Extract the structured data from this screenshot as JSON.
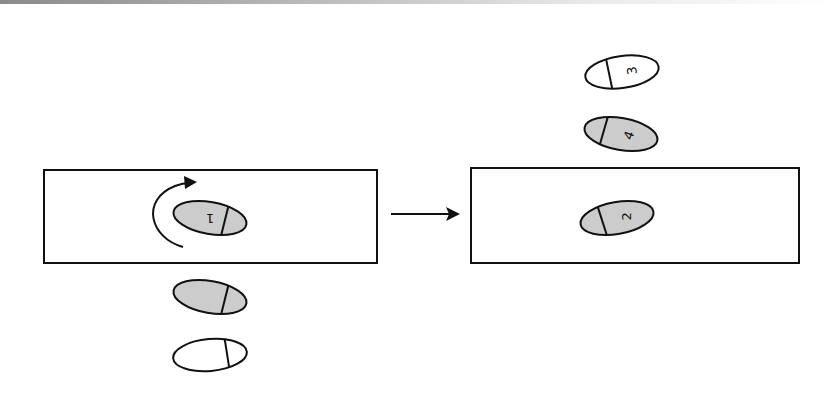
{
  "diagram": {
    "colors": {
      "stroke": "#111111",
      "filled_foot": "#cccccc",
      "empty_foot": "#ffffff",
      "background": "#ffffff"
    },
    "panels": [
      {
        "name": "before",
        "feet": [
          {
            "id": "foot-1",
            "label": "1",
            "filled": true,
            "in_box": true,
            "heel_side": "right"
          },
          {
            "id": "foot-gray-below",
            "label": "",
            "filled": true,
            "in_box": false,
            "heel_side": "right"
          },
          {
            "id": "foot-white-bottom",
            "label": "",
            "filled": false,
            "in_box": false,
            "heel_side": "right"
          }
        ],
        "rotation_arrow": "counter-clockwise-turn"
      },
      {
        "name": "after",
        "feet": [
          {
            "id": "foot-3",
            "label": "3",
            "filled": false,
            "in_box": false,
            "heel_side": "left"
          },
          {
            "id": "foot-4",
            "label": "4",
            "filled": true,
            "in_box": false,
            "heel_side": "left"
          },
          {
            "id": "foot-2",
            "label": "2",
            "filled": true,
            "in_box": true,
            "heel_side": "left"
          }
        ]
      }
    ],
    "transition_arrow": "right-arrow"
  }
}
